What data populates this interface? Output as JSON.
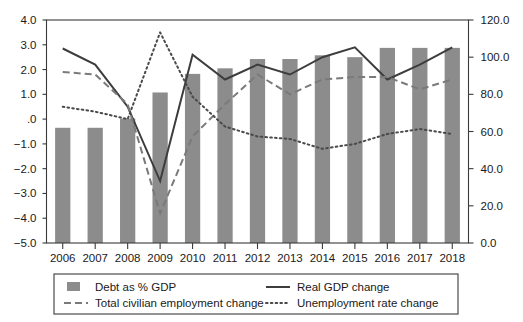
{
  "chart_data": {
    "type": "bar",
    "title": "",
    "subtitle": "",
    "xlabel": "",
    "ylabel": "",
    "categories": [
      "2006",
      "2007",
      "2008",
      "2009",
      "2010",
      "2011",
      "2012",
      "2013",
      "2014",
      "2015",
      "2016",
      "2017",
      "2018"
    ],
    "left_axis": {
      "label": "",
      "ylim": [
        -5.0,
        4.0
      ],
      "ticks": [
        4.0,
        3.0,
        2.0,
        1.0,
        0.0,
        -1.0,
        -2.0,
        -3.0,
        -4.0,
        -5.0
      ],
      "tick_labels": [
        "4.0",
        "3.0",
        "2.0",
        "1.0",
        ".0",
        "−1.0",
        "−2.0",
        "−3.0",
        "−4.0",
        "−5.0"
      ]
    },
    "right_axis": {
      "label": "",
      "ylim": [
        0.0,
        120.0
      ],
      "ticks": [
        120.0,
        100.0,
        80.0,
        60.0,
        40.0,
        20.0,
        0.0
      ],
      "tick_labels": [
        "120.0",
        "100.0",
        "80.0",
        "60.0",
        "40.0",
        "20.0",
        "0.0"
      ]
    },
    "grid": false,
    "legend_position": "bottom",
    "series": [
      {
        "name": "Debt as % GDP",
        "kind": "bar",
        "axis": "right",
        "color": "#8c8c8c",
        "values": [
          62,
          62,
          67,
          81,
          91,
          94,
          99,
          99,
          101,
          100,
          105,
          105,
          105
        ]
      },
      {
        "name": "Real GDP change",
        "kind": "line-solid",
        "axis": "left",
        "color": "#3d3d3d",
        "values": [
          2.85,
          2.2,
          0.5,
          -2.5,
          2.6,
          1.6,
          2.2,
          1.8,
          2.5,
          2.9,
          1.6,
          2.2,
          2.9
        ]
      },
      {
        "name": "Total civilian employment change",
        "kind": "line-dashed",
        "axis": "left",
        "color": "#7a7a7a",
        "values": [
          1.9,
          1.8,
          0.6,
          -3.8,
          -0.7,
          0.6,
          1.8,
          1.0,
          1.6,
          1.7,
          1.7,
          1.2,
          1.6
        ]
      },
      {
        "name": "Unemployment rate change",
        "kind": "line-dotted",
        "axis": "left",
        "color": "#4a4a4a",
        "values": [
          0.5,
          0.3,
          0.0,
          3.5,
          0.9,
          -0.3,
          -0.7,
          -0.8,
          -1.2,
          -1.0,
          -0.6,
          -0.4,
          -0.6
        ]
      }
    ]
  },
  "legend": {
    "items": [
      {
        "label": "Debt as % GDP",
        "marker": "swatch"
      },
      {
        "label": "Real GDP change",
        "marker": "solid-line"
      },
      {
        "label": "Total civilian employment change",
        "marker": "dashed-line"
      },
      {
        "label": "Unemployment rate change",
        "marker": "dotted-line"
      }
    ]
  }
}
